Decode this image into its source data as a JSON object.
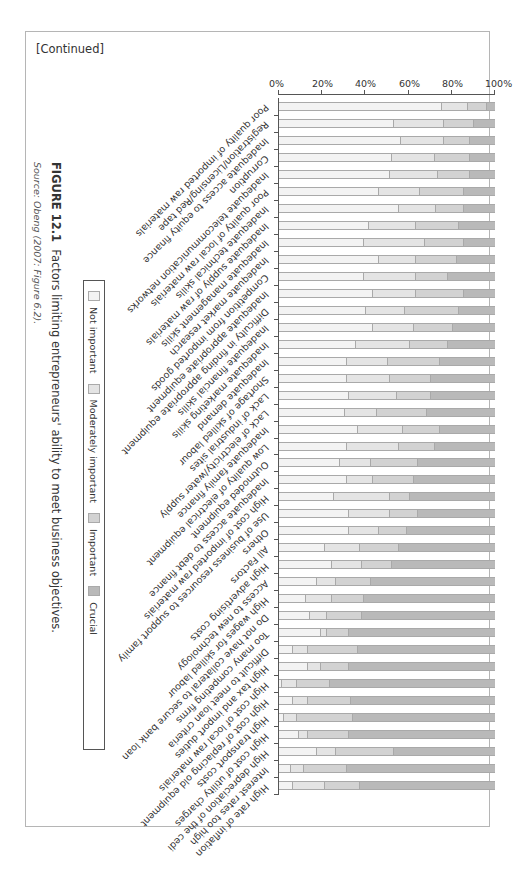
{
  "header": {
    "continued": "[Continued]"
  },
  "figure": {
    "label": "FIGURE 12.1",
    "caption": "Factors limiting entrepreneurs' ability to meet business objectives.",
    "source": "Source: Obeng (2007: Figure 6.2)."
  },
  "legend": {
    "items": [
      {
        "label": "Not important",
        "color": "#f3f3f3"
      },
      {
        "label": "Moderately important",
        "color": "#e4e4e4"
      },
      {
        "label": "Important",
        "color": "#d2d2d2"
      },
      {
        "label": "Crucial",
        "color": "#b9b9b9"
      }
    ]
  },
  "chart_data": {
    "type": "bar",
    "stacked": true,
    "orientation": "rotated-90",
    "title": "Factors limiting entrepreneurs' ability to meet business objectives.",
    "ylabel": "",
    "xlabel": "",
    "ylim": [
      0,
      100
    ],
    "yticks": [
      "0%",
      "20%",
      "40%",
      "60%",
      "80%",
      "100%"
    ],
    "categories": [
      "High rate of inflation",
      "Interest rates too high",
      "High depreciation of the cedi",
      "High cost of utility charges",
      "High transport costs",
      "High cost of replacing old equipment",
      "High cost of local raw materials",
      "High tax and import duties",
      "Difficult to meet loan criteria",
      "Too many competing firms",
      "Do not have collateral to secure bank loan",
      "High wages for skilled labour",
      "Access to new technology",
      "High advertising costs",
      "All Factors",
      "Others",
      "Use of business resources to support family",
      "High cost of imported raw materials",
      "Inadequate access to debt finance",
      "Outmoded equipment",
      "Low quality of electrical equipment",
      "Inadequate family finance",
      "Lack of electricity/water supply",
      "Lack of industrial sites",
      "Shortage of skilled labour",
      "Inadequate demand",
      "Inadequate marketing skills",
      "Inadequate financial skills",
      "Difficulty in finding appropriate equipment",
      "Inadequate appropriate equipment",
      "Competition from imported goods",
      "Inadequate market research",
      "Inadequate management skills",
      "Inadequate supply of raw materials",
      "Inadequate technical skills",
      "Poor quality of local raw materials",
      "Inadequate telecommunication networks",
      "Corruption",
      "Inadequate access to equity finance",
      "Registration/Licensing/Red tape",
      "Poor quality of imported raw materials"
    ],
    "series": [
      {
        "name": "Crucial",
        "values": [
          63,
          69,
          47,
          68,
          66,
          67,
          77,
          68,
          64,
          68,
          62,
          61,
          58,
          48,
          45,
          41,
          36,
          40,
          38,
          36,
          28,
          26,
          32,
          30,
          30,
          26,
          22,
          20,
          17,
          15,
          22,
          18,
          15,
          17,
          15,
          15,
          12,
          12,
          12,
          10,
          4
        ]
      },
      {
        "name": "Important",
        "values": [
          16,
          20,
          27,
          19,
          26,
          20,
          15,
          13,
          23,
          10,
          16,
          15,
          16,
          14,
          18,
          13,
          13,
          9,
          19,
          22,
          17,
          17,
          23,
          16,
          19,
          24,
          18,
          18,
          25,
          22,
          15,
          19,
          18,
          20,
          13,
          20,
          15,
          16,
          12,
          14,
          9
        ]
      },
      {
        "name": "Moderately important",
        "values": [
          15,
          6,
          9,
          4,
          6,
          7,
          7,
          6,
          7,
          3,
          8,
          12,
          9,
          14,
          16,
          14,
          19,
          26,
          12,
          14,
          24,
          21,
          15,
          22,
          20,
          19,
          25,
          19,
          18,
          20,
          24,
          17,
          28,
          22,
          17,
          19,
          22,
          20,
          20,
          23,
          12
        ]
      },
      {
        "name": "Not important",
        "values": [
          6,
          5,
          17,
          9,
          2,
          6,
          1,
          13,
          6,
          19,
          14,
          12,
          17,
          24,
          21,
          32,
          32,
          25,
          31,
          28,
          31,
          36,
          30,
          32,
          31,
          31,
          35,
          43,
          40,
          43,
          39,
          46,
          39,
          41,
          55,
          46,
          51,
          52,
          56,
          53,
          75
        ]
      }
    ]
  }
}
